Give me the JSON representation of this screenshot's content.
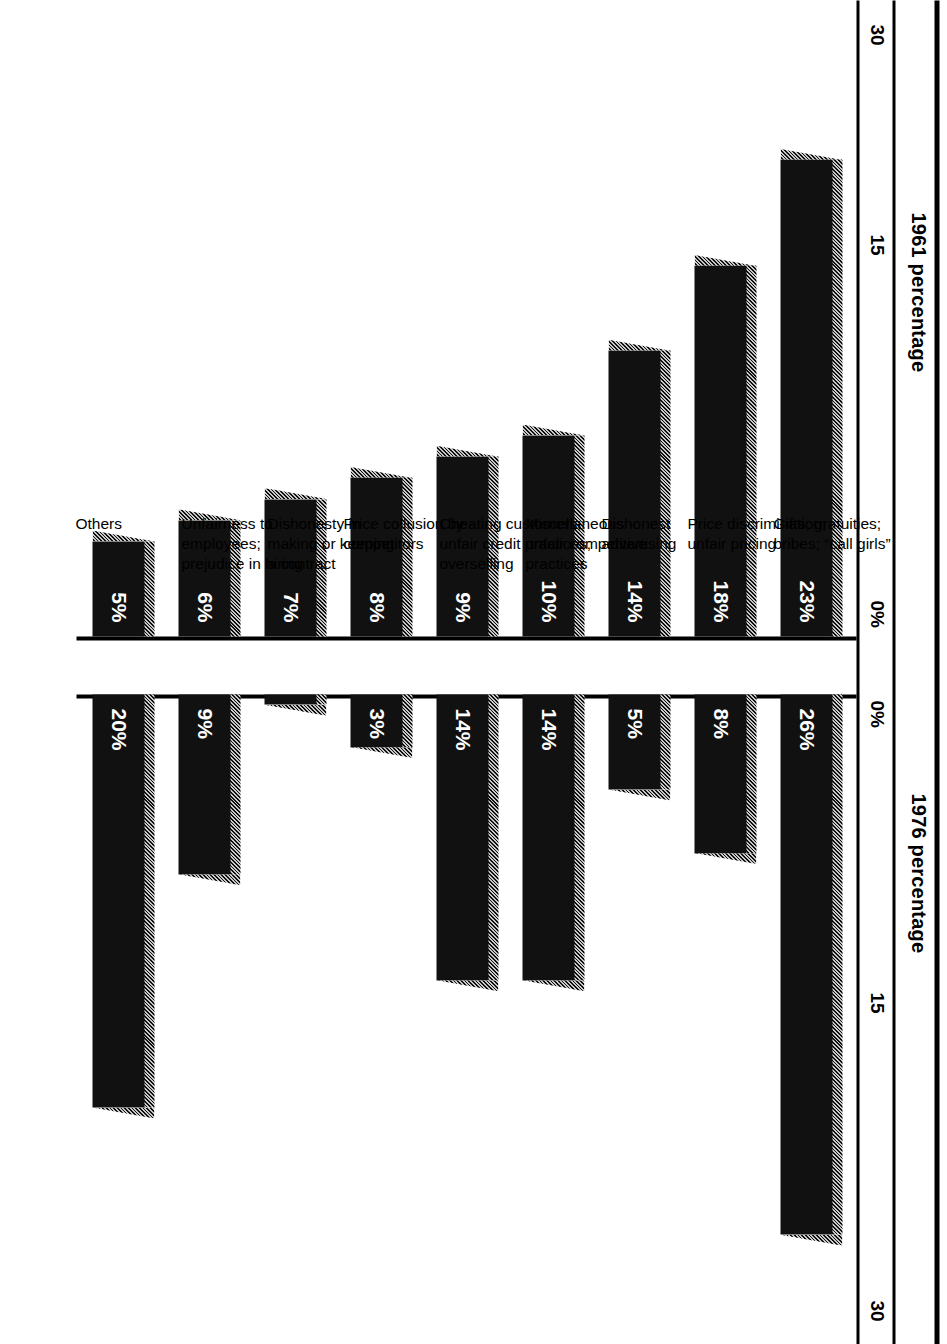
{
  "figure": {
    "left_panel_title": "1961 percentage",
    "right_panel_title": "1976 percentage",
    "left_ticks": [
      "30",
      "15",
      "0%"
    ],
    "right_ticks": [
      "0%",
      "15",
      "30"
    ]
  },
  "chart_data": {
    "type": "bar",
    "orientation": "horizontal-diverging",
    "xlabel": "",
    "ylabel": "",
    "xlim": [
      0,
      30
    ],
    "grid": false,
    "legend_position": "top",
    "categories": [
      "Gifts; gratuities; bribes; “call girls”",
      "Price discrimination; unfair pricing",
      "Dishonest advertising",
      "Miscellaneous unfair competitive practices",
      "Cheating customers; unfair credit practices; overselling",
      "Price collusion by competitors",
      "Dishonesty in making or keeping a contract",
      "Unfairness to employees; prejudice in hiring",
      "Others"
    ],
    "category_lines": [
      [
        "Gifts; gratuities;",
        "bribes; “call girls”"
      ],
      [
        "Price discrimination;",
        "unfair pricing"
      ],
      [
        "Dishonest",
        "advertising"
      ],
      [
        "Miscellaneous",
        "unfair competitive",
        "practices"
      ],
      [
        "Cheating customers;",
        "unfair credit practices;",
        "overselling"
      ],
      [
        "Price collusion by",
        "competitors"
      ],
      [
        "Dishonesty in",
        "making or keeping",
        "a contract"
      ],
      [
        "Unfairness to",
        "employees;",
        "prejudice in hiring"
      ],
      [
        "Others"
      ]
    ],
    "series": [
      {
        "name": "1961 percentage",
        "values": [
          23,
          18,
          14,
          10,
          9,
          8,
          7,
          6,
          5
        ],
        "labels": [
          "23%",
          "18%",
          "14%",
          "10%",
          "9%",
          "8%",
          "7%",
          "6%",
          "5%"
        ]
      },
      {
        "name": "1976 percentage",
        "values": [
          26,
          8,
          5,
          14,
          14,
          3,
          1,
          9,
          20
        ],
        "labels": [
          "26%",
          "8%",
          "5%",
          "14%",
          "14%",
          "3%",
          "1%",
          "9%",
          "20%"
        ]
      }
    ],
    "colors": {
      "bar_face": "#111111",
      "bar_top_hatch": "#bfbfbf",
      "value_label": "#ffffff",
      "axis": "#000000",
      "background": "#ffffff"
    }
  }
}
